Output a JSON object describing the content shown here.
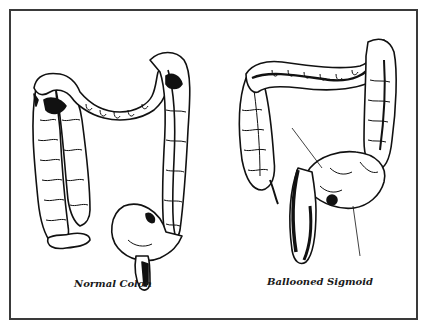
{
  "figure": {
    "panels": [
      {
        "id": "normal",
        "caption": "Normal Colon"
      },
      {
        "id": "ballooned",
        "caption": "Ballooned Sigmoid"
      }
    ],
    "colors": {
      "ink": "#111111",
      "frame": "#3a3a3a",
      "background": "#ffffff"
    }
  }
}
